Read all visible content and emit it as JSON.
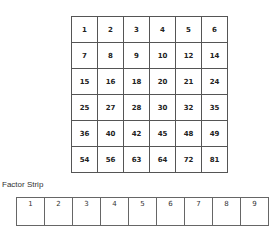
{
  "grid": {
    "rows": [
      [
        1,
        2,
        3,
        4,
        5,
        6
      ],
      [
        7,
        8,
        9,
        10,
        12,
        14
      ],
      [
        15,
        16,
        18,
        20,
        21,
        24
      ],
      [
        25,
        27,
        28,
        30,
        32,
        35
      ],
      [
        36,
        40,
        42,
        45,
        48,
        49
      ],
      [
        54,
        56,
        63,
        64,
        72,
        81
      ]
    ]
  },
  "factor_strip": {
    "label": "Factor Strip",
    "cells": [
      1,
      2,
      3,
      4,
      5,
      6,
      7,
      8,
      9
    ]
  }
}
